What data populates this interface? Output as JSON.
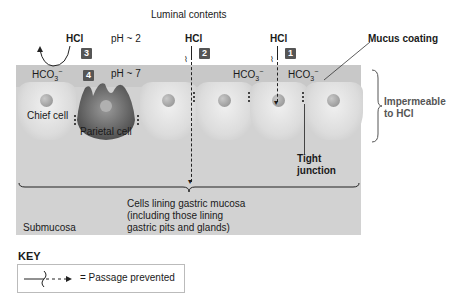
{
  "title": "Luminal contents",
  "hcl_label": "HCl",
  "hco3_base": "HCO",
  "hco3_sub": "3",
  "hco3_sup": "−",
  "ph_lumen": "pH ~ 2",
  "ph_mucus": "pH ~ 7",
  "badges": [
    "1",
    "2",
    "3",
    "4"
  ],
  "labels": {
    "mucus_coating": "Mucus coating",
    "impermeable_1": "Impermeable",
    "impermeable_2": "to HCl",
    "chief_cell": "Chief cell",
    "parietal_cell": "Parietal cell",
    "tight_junction_1": "Tight",
    "tight_junction_2": "junction",
    "cells_lining_1": "Cells lining gastric mucosa",
    "cells_lining_2": "(including those lining",
    "cells_lining_3": "gastric pits and glands)",
    "submucosa": "Submucosa"
  },
  "key": {
    "title": "KEY",
    "description": "= Passage prevented"
  }
}
